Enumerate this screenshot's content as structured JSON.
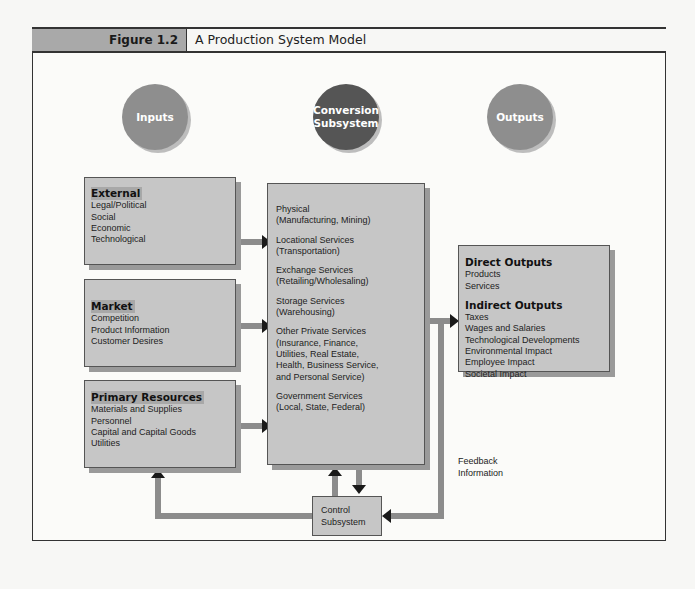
{
  "figure": {
    "label": "Figure 1.2",
    "title": "A Production System Model"
  },
  "circles": {
    "inputs": "Inputs",
    "conversion_line1": "Conversion",
    "conversion_line2": "Subsystem",
    "outputs": "Outputs"
  },
  "inputs": {
    "external": {
      "heading": "External",
      "items": [
        "Legal/Political",
        "Social",
        "Economic",
        "Technological"
      ]
    },
    "market": {
      "heading": "Market",
      "items": [
        "Competition",
        "Product Information",
        "Customer Desires"
      ]
    },
    "primary_resources": {
      "heading": "Primary Resources",
      "items": [
        "Materials and Supplies",
        "Personnel",
        "Capital and Capital Goods",
        "Utilities"
      ]
    }
  },
  "conversion": {
    "groups": [
      {
        "lines": [
          "Physical",
          "(Manufacturing, Mining)"
        ]
      },
      {
        "lines": [
          "Locational Services",
          "(Transportation)"
        ]
      },
      {
        "lines": [
          "Exchange Services",
          "(Retailing/Wholesaling)"
        ]
      },
      {
        "lines": [
          "Storage Services",
          "(Warehousing)"
        ]
      },
      {
        "lines": [
          "Other Private Services",
          "(Insurance, Finance,",
          "Utilities, Real Estate,",
          "Health, Business Service,",
          "and Personal Service)"
        ]
      },
      {
        "lines": [
          "Government Services",
          "(Local, State, Federal)"
        ]
      }
    ]
  },
  "outputs": {
    "direct": {
      "heading": "Direct Outputs",
      "items": [
        "Products",
        "Services"
      ]
    },
    "indirect": {
      "heading": "Indirect Outputs",
      "items": [
        "Taxes",
        "Wages and Salaries",
        "Technological Developments",
        "Environmental Impact",
        "Employee Impact",
        "Societal Impact"
      ]
    }
  },
  "control": {
    "line1": "Control",
    "line2": "Subsystem"
  },
  "feedback": {
    "line1": "Feedback",
    "line2": "Information"
  },
  "colors": {
    "box_fill": "#c6c6c6",
    "circle_light": "#8e8e8e",
    "circle_dark": "#555555",
    "pipe": "#8c8c8c",
    "arrowhead": "#1a1a1a"
  }
}
